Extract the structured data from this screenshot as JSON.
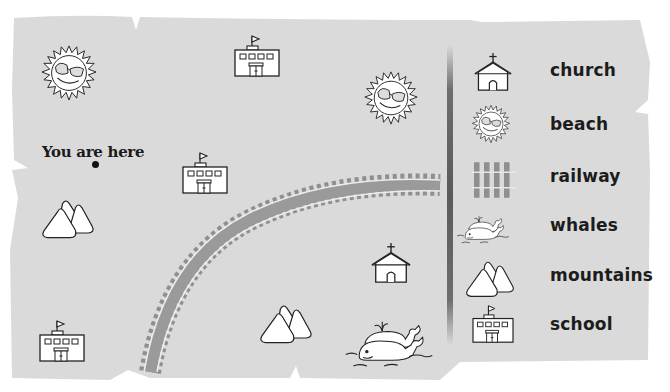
{
  "map": {
    "you_are_here_label": "You are here",
    "background_color": "#dadada",
    "railway_color": "#8f8f8f",
    "features": [
      {
        "type": "beach",
        "x": 68,
        "y": 72
      },
      {
        "type": "school",
        "x": 254,
        "y": 58
      },
      {
        "type": "beach",
        "x": 392,
        "y": 97
      },
      {
        "type": "school",
        "x": 205,
        "y": 175
      },
      {
        "type": "mountains",
        "x": 68,
        "y": 210
      },
      {
        "type": "railway",
        "from": "bottom-left",
        "to": "top-right"
      },
      {
        "type": "church",
        "x": 392,
        "y": 270
      },
      {
        "type": "mountains",
        "x": 285,
        "y": 320
      },
      {
        "type": "whales",
        "x": 393,
        "y": 345
      },
      {
        "type": "school",
        "x": 62,
        "y": 343
      }
    ]
  },
  "legend": {
    "items": [
      {
        "icon": "church-icon",
        "label": "church"
      },
      {
        "icon": "beach-icon",
        "label": "beach"
      },
      {
        "icon": "railway-icon",
        "label": "railway"
      },
      {
        "icon": "whales-icon",
        "label": "whales"
      },
      {
        "icon": "mountains-icon",
        "label": "mountains"
      },
      {
        "icon": "school-icon",
        "label": "school"
      }
    ]
  }
}
